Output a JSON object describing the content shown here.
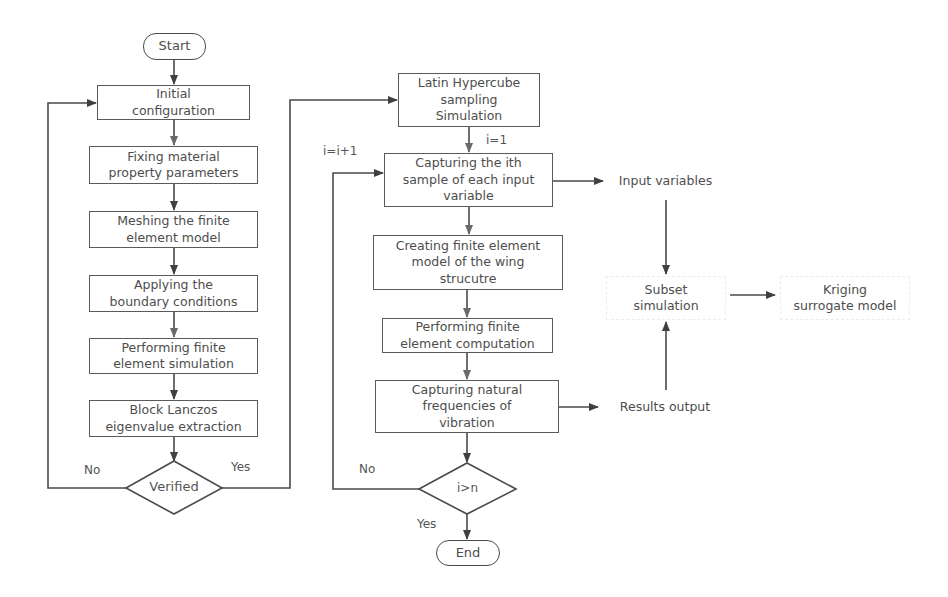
{
  "colors": {
    "line": "#4a4a4a",
    "text": "#4d4d4d",
    "background": "#ffffff"
  },
  "left_flow": {
    "start": "Start",
    "steps": [
      "Initial\nconfiguration",
      "Fixing material\nproperty parameters",
      "Meshing the finite\nelement model",
      "Applying the\nboundary conditions",
      "Performing finite\nelement simulation",
      "Block Lanczos\neigenvalue extraction"
    ],
    "decision": "Verified",
    "no_label": "No",
    "yes_label": "Yes"
  },
  "middle_flow": {
    "steps": [
      "Latin Hypercube\nsampling\nSimulation",
      "Capturing the ith\nsample of each input\nvariable",
      "Creating finite element\nmodel of the wing\nstrucutre",
      "Performing finite\nelement computation",
      "Capturing natural\nfrequencies of\nvibration"
    ],
    "init_label": "i=1",
    "increment_label": "i=i+1",
    "decision": "i>n",
    "no_label": "No",
    "yes_label": "Yes",
    "end": "End"
  },
  "right_flow": {
    "input_variables": "Input variables",
    "results_output": "Results output",
    "subset_simulation": "Subset\nsimulation",
    "kriging": "Kriging\nsurrogate model"
  }
}
